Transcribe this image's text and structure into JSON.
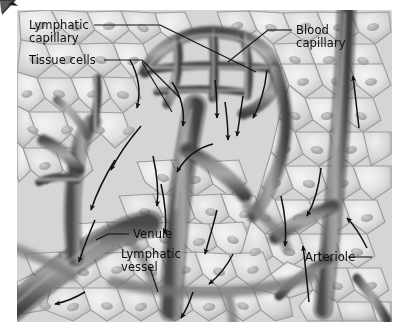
{
  "figure": {
    "style": "grayscale anatomical illustration",
    "background_color": "#ffffff",
    "plate_color_light": "#eaeaea",
    "plate_color_mid": "#b9b9b9",
    "plate_color_dark": "#6d6d6d",
    "label_color": "#0d0d0d",
    "leader_color": "#141414",
    "arrow_color": "#111111"
  },
  "labels": {
    "lymphatic_capillary": "Lymphatic\ncapillary",
    "tissue_cells": "Tissue cells",
    "blood_capillary": "Blood\ncapillary",
    "venule": "Venule",
    "lymphatic_vessel": "Lymphatic\nvessel",
    "arteriole": "Arteriole"
  },
  "label_list": [
    {
      "id": "lymphatic-capillary",
      "text": "Lymphatic capillary",
      "x": 29,
      "y": 19
    },
    {
      "id": "tissue-cells",
      "text": "Tissue cells",
      "x": 29,
      "y": 54
    },
    {
      "id": "blood-capillary",
      "text": "Blood capillary",
      "x": 296,
      "y": 24
    },
    {
      "id": "venule",
      "text": "Venule",
      "x": 133,
      "y": 228
    },
    {
      "id": "lymphatic-vessel",
      "text": "Lymphatic vessel",
      "x": 121,
      "y": 248
    },
    {
      "id": "arteriole",
      "text": "Arteriole",
      "x": 305,
      "y": 251
    }
  ],
  "annotations": {
    "flow_arrow_count": 14,
    "leader_line_count": 6,
    "corner_artifact": "page-curl"
  }
}
